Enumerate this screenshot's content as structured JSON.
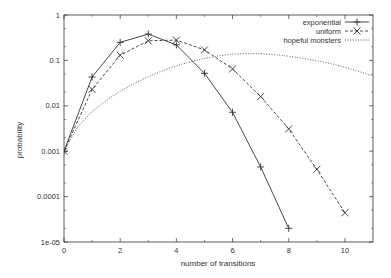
{
  "chart_data": {
    "type": "line",
    "title": "",
    "xlabel": "number of transitions",
    "ylabel": "probability",
    "xscale": "linear",
    "yscale": "log",
    "xlim": [
      0,
      11
    ],
    "ylim": [
      1e-05,
      1
    ],
    "xticks": [
      0,
      2,
      4,
      6,
      8,
      10
    ],
    "xtick_labels": [
      "0",
      "2",
      "4",
      "6",
      "8",
      "10"
    ],
    "yticks": [
      1,
      0.1,
      0.01,
      0.001,
      0.0001,
      1e-05
    ],
    "ytick_labels": [
      "1",
      "0.1",
      "0.01",
      "0.001",
      "0.0001",
      "1e-05"
    ],
    "grid": false,
    "legend_position": "top-right",
    "series": [
      {
        "name": "exponential",
        "style": "solid",
        "marker": "+",
        "x": [
          0,
          1,
          2,
          3,
          4,
          5,
          6,
          7,
          8
        ],
        "values": [
          0.001,
          0.043,
          0.25,
          0.38,
          0.22,
          0.052,
          0.0072,
          0.00045,
          2e-05
        ]
      },
      {
        "name": "uniform",
        "style": "dashed",
        "marker": "x",
        "x": [
          0,
          1,
          2,
          3,
          4,
          5,
          6,
          7,
          8,
          9,
          10
        ],
        "values": [
          0.001,
          0.023,
          0.13,
          0.27,
          0.28,
          0.17,
          0.065,
          0.016,
          0.0031,
          0.0004,
          4.4e-05
        ]
      },
      {
        "name": "hopeful monsters",
        "style": "dotted",
        "marker": "none",
        "x": [
          0,
          0.5,
          1,
          1.5,
          2,
          2.5,
          3,
          3.5,
          4,
          4.5,
          5,
          5.5,
          6,
          6.5,
          7,
          7.5,
          8,
          8.5,
          9,
          9.5,
          10,
          10.5,
          11
        ],
        "values": [
          0.001,
          0.0035,
          0.0075,
          0.013,
          0.021,
          0.031,
          0.044,
          0.059,
          0.076,
          0.093,
          0.11,
          0.125,
          0.138,
          0.142,
          0.14,
          0.134,
          0.124,
          0.112,
          0.098,
          0.085,
          0.071,
          0.057,
          0.045
        ]
      }
    ]
  }
}
